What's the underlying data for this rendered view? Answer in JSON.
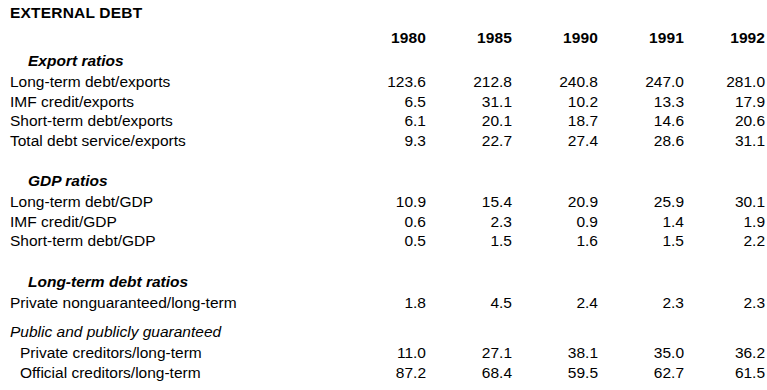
{
  "document": {
    "title": "EXTERNAL DEBT"
  },
  "table": {
    "row_label_header": "",
    "columns": [
      "1980",
      "1985",
      "1990",
      "1991",
      "1992"
    ],
    "sections": [
      {
        "heading": "Export ratios",
        "heading_style": "bold-italic",
        "rows": [
          {
            "label": "Long-term debt/exports",
            "indent": 0,
            "values": [
              "123.6",
              "212.8",
              "240.8",
              "247.0",
              "281.0"
            ]
          },
          {
            "label": "IMF credit/exports",
            "indent": 0,
            "values": [
              "6.5",
              "31.1",
              "10.2",
              "13.3",
              "17.9"
            ]
          },
          {
            "label": "Short-term debt/exports",
            "indent": 0,
            "values": [
              "6.1",
              "20.1",
              "18.7",
              "14.6",
              "20.6"
            ]
          },
          {
            "label": "Total debt service/exports",
            "indent": 0,
            "values": [
              "9.3",
              "22.7",
              "27.4",
              "28.6",
              "31.1"
            ]
          }
        ]
      },
      {
        "heading": "GDP ratios",
        "heading_style": "bold-italic",
        "rows": [
          {
            "label": "Long-term debt/GDP",
            "indent": 0,
            "values": [
              "10.9",
              "15.4",
              "20.9",
              "25.9",
              "30.1"
            ]
          },
          {
            "label": "IMF credit/GDP",
            "indent": 0,
            "values": [
              "0.6",
              "2.3",
              "0.9",
              "1.4",
              "1.9"
            ]
          },
          {
            "label": "Short-term debt/GDP",
            "indent": 0,
            "values": [
              "0.5",
              "1.5",
              "1.6",
              "1.5",
              "2.2"
            ]
          }
        ]
      },
      {
        "heading": "Long-term debt ratios",
        "heading_style": "bold-italic",
        "rows": [
          {
            "label": "Private nonguaranteed/long-term",
            "indent": 0,
            "values": [
              "1.8",
              "4.5",
              "2.4",
              "2.3",
              "2.3"
            ]
          }
        ]
      },
      {
        "heading": "Public and publicly guaranteed",
        "heading_style": "italic",
        "rows": [
          {
            "label": "Private creditors/long-term",
            "indent": 1,
            "values": [
              "11.0",
              "27.1",
              "38.1",
              "35.0",
              "36.2"
            ]
          },
          {
            "label": "Official creditors/long-term",
            "indent": 1,
            "values": [
              "87.2",
              "68.4",
              "59.5",
              "62.7",
              "61.5"
            ]
          }
        ]
      }
    ]
  },
  "chart_data": {
    "type": "table",
    "title": "EXTERNAL DEBT",
    "categories": [
      "1980",
      "1985",
      "1990",
      "1991",
      "1992"
    ],
    "xlabel": "Year",
    "ylabel": "Ratio (percent)",
    "grid": false,
    "legend": "none",
    "series": [
      {
        "name": "Long-term debt/exports",
        "group": "Export ratios",
        "values": [
          123.6,
          212.8,
          240.8,
          247.0,
          281.0
        ]
      },
      {
        "name": "IMF credit/exports",
        "group": "Export ratios",
        "values": [
          6.5,
          31.1,
          10.2,
          13.3,
          17.9
        ]
      },
      {
        "name": "Short-term debt/exports",
        "group": "Export ratios",
        "values": [
          6.1,
          20.1,
          18.7,
          14.6,
          20.6
        ]
      },
      {
        "name": "Total debt service/exports",
        "group": "Export ratios",
        "values": [
          9.3,
          22.7,
          27.4,
          28.6,
          31.1
        ]
      },
      {
        "name": "Long-term debt/GDP",
        "group": "GDP ratios",
        "values": [
          10.9,
          15.4,
          20.9,
          25.9,
          30.1
        ]
      },
      {
        "name": "IMF credit/GDP",
        "group": "GDP ratios",
        "values": [
          0.6,
          2.3,
          0.9,
          1.4,
          1.9
        ]
      },
      {
        "name": "Short-term debt/GDP",
        "group": "GDP ratios",
        "values": [
          0.5,
          1.5,
          1.6,
          1.5,
          2.2
        ]
      },
      {
        "name": "Private nonguaranteed/long-term",
        "group": "Long-term debt ratios",
        "values": [
          1.8,
          4.5,
          2.4,
          2.3,
          2.3
        ]
      },
      {
        "name": "Private creditors/long-term",
        "group": "Public and publicly guaranteed",
        "values": [
          11.0,
          27.1,
          38.1,
          35.0,
          36.2
        ]
      },
      {
        "name": "Official creditors/long-term",
        "group": "Public and publicly guaranteed",
        "values": [
          87.2,
          68.4,
          59.5,
          62.7,
          61.5
        ]
      }
    ]
  }
}
